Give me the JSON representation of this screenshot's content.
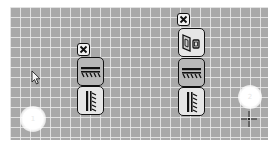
{
  "canvas": {
    "background": "#a9a9a9",
    "grid_color": "#ebebeb",
    "grid_spacing_px": 10
  },
  "left_toolbar": {
    "close_icon": "close-x-icon",
    "buttons": [
      {
        "icon": "horizontal-hatch-surface-icon",
        "active": true
      },
      {
        "icon": "vertical-hatch-surface-icon",
        "active": false
      }
    ]
  },
  "right_toolbar": {
    "close_icon": "close-x-icon",
    "buttons": [
      {
        "icon": "door-window-icon",
        "active": false
      },
      {
        "icon": "horizontal-hatch-surface-icon",
        "active": true
      },
      {
        "icon": "vertical-hatch-surface-icon",
        "active": false
      }
    ]
  },
  "markers": [
    {
      "name": "glow-marker-left",
      "label": "1"
    },
    {
      "name": "glow-marker-right",
      "label": "2"
    }
  ],
  "cursor": {
    "type": "arrow-pointer-icon"
  },
  "crosshair": {
    "type": "crosshair-icon"
  }
}
